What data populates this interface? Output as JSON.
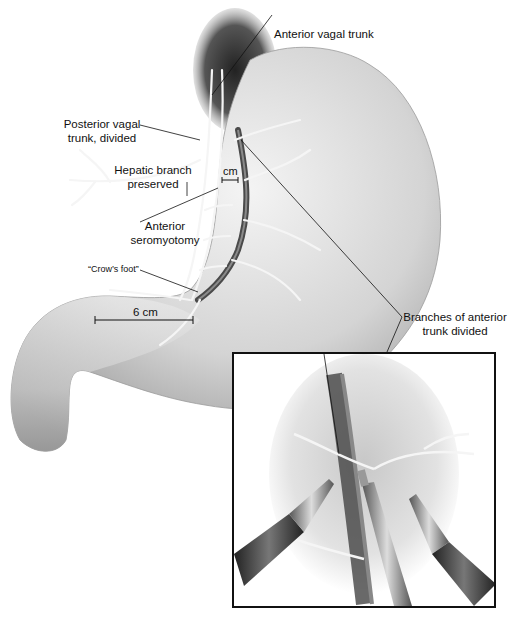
{
  "figure": {
    "labels": {
      "anterior_vagal_trunk": "Anterior vagal trunk",
      "posterior_vagal_trunk_line1": "Posterior vagal",
      "posterior_vagal_trunk_line2": "trunk, divided",
      "hepatic_branch_line1": "Hepatic branch",
      "hepatic_branch_line2": "preserved",
      "cm_marker": "cm",
      "seromyotomy_line1": "Anterior",
      "seromyotomy_line2": "seromyotomy",
      "crows_foot": "“Crow’s foot”",
      "six_cm": "6 cm",
      "branches_line1": "Branches of anterior",
      "branches_line2": "trunk divided"
    },
    "inset": {
      "description": "Laparoscopic view: grasper and dissector dividing anterior trunk branches",
      "instruments": [
        "left-grasper",
        "center-clip-applier",
        "right-grasper"
      ]
    },
    "colors": {
      "stomach_fill": "#d9d9d9",
      "stomach_shadow": "#9a9a9a",
      "esophagus": "#3a3a3a",
      "nerve": "#f2f2f2",
      "line": "#111111",
      "inset_border": "#111111"
    }
  }
}
